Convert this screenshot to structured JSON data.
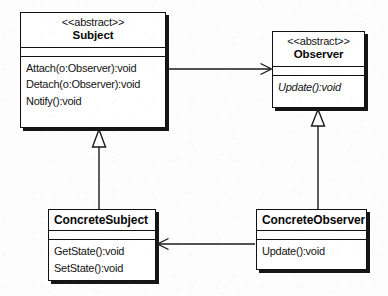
{
  "diagram": {
    "notation": "UML",
    "stereotype_label": "<<abstract>>",
    "stroke_color": "#1a1a1a",
    "fill_color": "#ffffff",
    "background_color": "#fdfdfd"
  },
  "classes": {
    "subject": {
      "stereotype": "<<abstract>>",
      "name": "Subject",
      "attributes": [],
      "operations": [
        {
          "signature": "Attach(o:Observer):void",
          "abstract": false
        },
        {
          "signature": "Detach(o:Observer):void",
          "abstract": false
        },
        {
          "signature": "Notify():void",
          "abstract": false
        }
      ]
    },
    "observer": {
      "stereotype": "<<abstract>>",
      "name": "Observer",
      "attributes": [],
      "operations": [
        {
          "signature": "Update():void",
          "abstract": true
        }
      ]
    },
    "concrete_subject": {
      "stereotype": "",
      "name": "ConcreteSubject",
      "attributes": [],
      "operations": [
        {
          "signature": "GetState():void",
          "abstract": false
        },
        {
          "signature": "SetState():void",
          "abstract": false
        }
      ]
    },
    "concrete_observer": {
      "stereotype": "",
      "name": "ConcreteObserver",
      "attributes": [],
      "operations": [
        {
          "signature": "Update():void",
          "abstract": false
        }
      ]
    }
  },
  "relationships": [
    {
      "id": "subject-to-observer",
      "type": "association",
      "arrow": "open",
      "from": "Subject",
      "to": "Observer",
      "label": ""
    },
    {
      "id": "concretesubject-to-subject",
      "type": "generalization",
      "arrow": "hollow-triangle",
      "from": "ConcreteSubject",
      "to": "Subject",
      "label": ""
    },
    {
      "id": "concreteobserver-to-observer",
      "type": "generalization",
      "arrow": "hollow-triangle",
      "from": "ConcreteObserver",
      "to": "Observer",
      "label": ""
    },
    {
      "id": "concreteobserver-to-concretesubject",
      "type": "association",
      "arrow": "open",
      "from": "ConcreteObserver",
      "to": "ConcreteSubject",
      "label": ""
    }
  ]
}
